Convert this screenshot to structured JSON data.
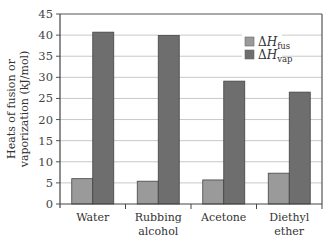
{
  "chart_data": {
    "type": "bar",
    "title": "",
    "xlabel": "",
    "ylabel": "Heats of fusion or vaporization (kJ/mol)",
    "ylabel_lines": [
      "Heats of fusion or",
      "vaporization (kJ/mol)"
    ],
    "ylim": [
      0,
      45
    ],
    "yticks": [
      0,
      5,
      10,
      15,
      20,
      25,
      30,
      35,
      40,
      45
    ],
    "grid": true,
    "legend_position": "upper right",
    "categories": [
      "Water",
      "Rubbing alcohol",
      "Acetone",
      "Diethyl ether"
    ],
    "category_lines": [
      [
        "Water"
      ],
      [
        "Rubbing",
        "alcohol"
      ],
      [
        "Acetone"
      ],
      [
        "Diethyl",
        "ether"
      ]
    ],
    "series": [
      {
        "name": "ΔH_fus",
        "symbol": "ΔH",
        "subscript": "fus",
        "color": "#9a9a9a",
        "values": [
          6.0,
          5.4,
          5.7,
          7.3
        ]
      },
      {
        "name": "ΔH_vap",
        "symbol": "ΔH",
        "subscript": "vap",
        "color": "#6e6e6e",
        "values": [
          40.7,
          39.9,
          29.1,
          26.5
        ]
      }
    ]
  }
}
